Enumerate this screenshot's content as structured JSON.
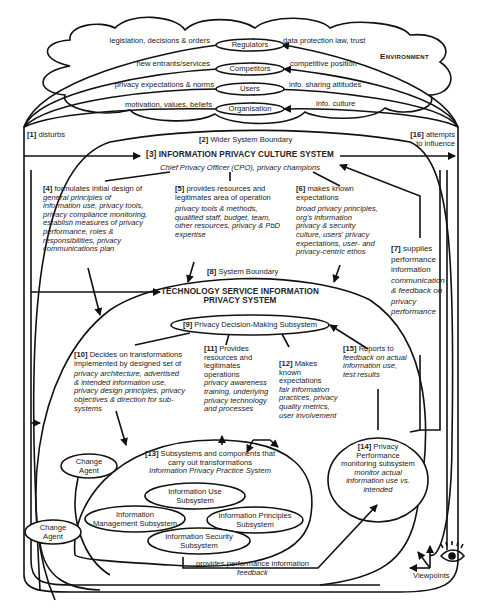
{
  "environment": {
    "label": "Environment",
    "actors": [
      {
        "name": "Regulators",
        "left_text": "legislation, decisions & orders",
        "right_text": "data protection law, trust"
      },
      {
        "name": "Competitors",
        "left_text": "new entrants/services",
        "right_text": "competitive position"
      },
      {
        "name": "Users",
        "left_text": "privacy expectations & norms",
        "right_text": "info. sharing attitudes"
      },
      {
        "name": "Organisation",
        "left_text": "motivation, values, beliefs",
        "right_text": "info. culture"
      }
    ]
  },
  "flows": {
    "f1": {
      "num": "[1]",
      "label": "disturbs"
    },
    "f2": {
      "num": "[2]",
      "label": "Wider System Boundary"
    },
    "f16": {
      "num": "[16]",
      "label_line1": "attempts",
      "label_line2": "to influence"
    }
  },
  "culture_system": {
    "title": "[3] INFORMATION PRIVACY CULTURE SYSTEM",
    "subtitle": "Chief Privacy Officer (CPO), privacy champions"
  },
  "step4": {
    "num": "[4]",
    "heading": "formulates initial design of",
    "detail": [
      "general principles of",
      "information use, privacy tools,",
      "privacy compliance monitoring,",
      "establish measures of privacy",
      "performance, roles &",
      "responsibilities, privacy",
      "communications plan"
    ]
  },
  "step5": {
    "num": "[5]",
    "heading": [
      "provides resources and",
      "legitimates area of operation"
    ],
    "detail": [
      "privacy tools & methods,",
      "qualified staff, budget, team,",
      "other resources, privacy & PbD",
      "expertise"
    ]
  },
  "step6": {
    "num": "[6]",
    "heading": [
      "makes known",
      "expectations"
    ],
    "detail": [
      "broad privacy principles,",
      "org's information",
      "privacy & security",
      "culture, users' privacy",
      "expectations, user- and",
      "privacy-centric ethos"
    ]
  },
  "step7": {
    "num": "[7]",
    "heading": [
      "supplies",
      "performance",
      "information"
    ],
    "detail": [
      "communication",
      "& feedback on",
      "privacy",
      "performance"
    ]
  },
  "step8": {
    "num": "[8]",
    "label": "System Boundary"
  },
  "tech_system": {
    "title_line1": "TECHNOLOGY SERVICE INFORMATION",
    "title_line2": "PRIVACY SYSTEM"
  },
  "step9": {
    "num": "[9]",
    "label": "Privacy Decision-Making Subsystem"
  },
  "step10": {
    "num": "[10]",
    "heading": [
      "Decides on transformations",
      "implemented by designed set of"
    ],
    "detail": [
      "privacy architecture, advertised",
      "& intended information use,",
      "privacy design principles, privacy",
      "objectives & direction for sub-",
      "systems"
    ]
  },
  "step11": {
    "num": "[11]",
    "heading": [
      "Provides",
      "resources and",
      "legitimates",
      "operations"
    ],
    "detail": [
      "privacy awareness",
      "training, underlying",
      "privacy technology",
      "and processes"
    ]
  },
  "step12": {
    "num": "[12]",
    "heading": [
      "Makes",
      "known",
      "expectations"
    ],
    "detail": [
      "fair information",
      "practices, privacy",
      "quality metrics,",
      "user involvement"
    ]
  },
  "step13": {
    "num": "[13]",
    "heading": [
      "Subsystems and components that",
      "carry out transformations"
    ],
    "detail": "Information Privacy Practice System"
  },
  "step14": {
    "num": "[14]",
    "heading": [
      "Privacy",
      "Performance",
      "monitoring subsystem"
    ],
    "detail": [
      "monitor actual",
      "information use vs.",
      "intended"
    ]
  },
  "step15": {
    "num": "[15]",
    "heading": "Reports to",
    "detail": [
      "feedback on actual",
      "information use,",
      "test results"
    ]
  },
  "subsystems": [
    {
      "line1": "Information Use",
      "line2": "Subsystem"
    },
    {
      "line1": "Information",
      "line2": "Management Subsystem"
    },
    {
      "line1": "Information Principles",
      "line2": "Subsystem"
    },
    {
      "line1": "Information Security",
      "line2": "Subsystem"
    }
  ],
  "change_agent_inner": {
    "line1": "Change",
    "line2": "Agent"
  },
  "change_agent_outer": {
    "line1": "Change",
    "line2": "Agent"
  },
  "feedback_flow": {
    "label": "provides performance information",
    "detail": "feedback"
  },
  "viewpoints": {
    "label": "Viewpoints"
  }
}
